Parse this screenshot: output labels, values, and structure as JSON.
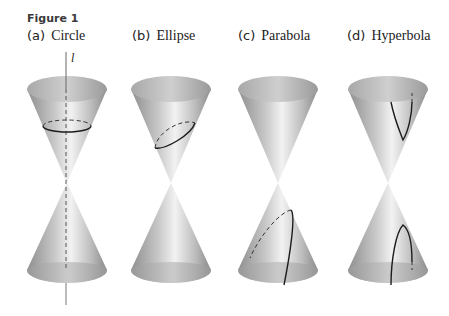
{
  "figure": {
    "label": "Figure 1",
    "axis_label": "l",
    "panels": [
      {
        "tag": "(a)",
        "title": "Circle",
        "section": "circle",
        "cx": 67
      },
      {
        "tag": "(b)",
        "title": "Ellipse",
        "section": "ellipse",
        "cx": 171
      },
      {
        "tag": "(c)",
        "title": "Parabola",
        "section": "parabola",
        "cx": 278
      },
      {
        "tag": "(d)",
        "title": "Hyperbola",
        "section": "hyperbola",
        "cx": 388
      }
    ],
    "colors": {
      "cone_light": "#efefef",
      "cone_mid": "#b8b8b8",
      "cone_dark": "#8a8a8a",
      "curve": "#1c1c1c"
    }
  }
}
